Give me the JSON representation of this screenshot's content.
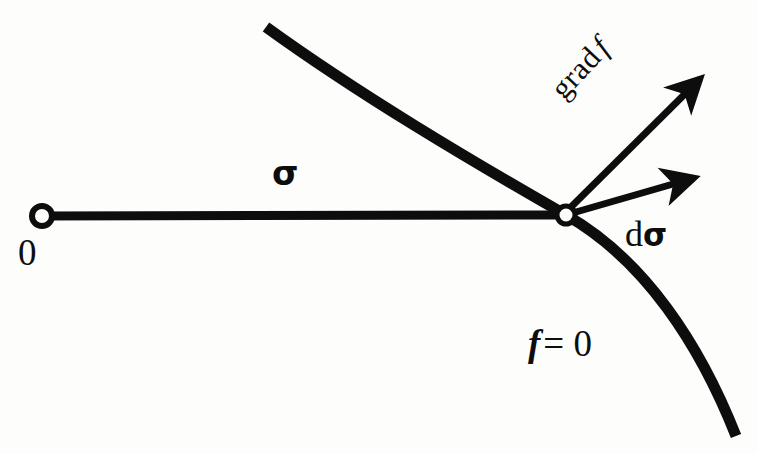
{
  "figure": {
    "type": "diagram",
    "background_color": "#fdfdfb",
    "ink_color": "#0d0d0d",
    "labels": {
      "origin": "0",
      "ray": "σ",
      "differential_d": "d",
      "differential_sigma": "σ",
      "level_set_f": "f",
      "level_set_rest": "= 0",
      "gradient_word": "grad",
      "gradient_f": "f"
    },
    "geometry": {
      "stroke_width_curve": 11,
      "stroke_width_ray": 9,
      "stroke_width_arrow": 7,
      "origin_point": [
        42,
        216
      ],
      "intersection_point": [
        566,
        215
      ],
      "junction_dot_radius": 9,
      "origin_dot_radius": 10,
      "ray_path": "M 42 216 L 566 215",
      "curve_path": "M 266 27 C 360 95 470 160 566 215 C 645 260 700 345 736 436",
      "gradient_arrow": {
        "from": [
          570,
          208
        ],
        "to": [
          706,
          73
        ],
        "angle_deg": -45
      },
      "dsigma_arrow": {
        "from": [
          576,
          212
        ],
        "to": [
          701,
          176
        ],
        "angle_deg": -16
      }
    }
  }
}
